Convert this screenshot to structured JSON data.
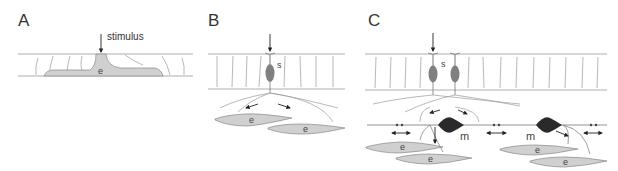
{
  "panels": [
    {
      "label": "A",
      "stimulus_label": "stimulus",
      "cells": [
        {
          "label": "e"
        }
      ]
    },
    {
      "label": "B",
      "cells": [
        {
          "label": "s"
        },
        {
          "label": "e"
        },
        {
          "label": "e"
        }
      ]
    },
    {
      "label": "C",
      "cells": [
        {
          "label": "s"
        },
        {
          "label": "m"
        },
        {
          "label": "m"
        },
        {
          "label": "e"
        },
        {
          "label": "e"
        },
        {
          "label": "e"
        },
        {
          "label": "e"
        }
      ]
    }
  ],
  "colors": {
    "effector_fill": "#d0d0d0",
    "sensory_fill": "#808080",
    "motor_fill": "#2a2a2a",
    "line": "#888888",
    "arrow": "#222222"
  }
}
